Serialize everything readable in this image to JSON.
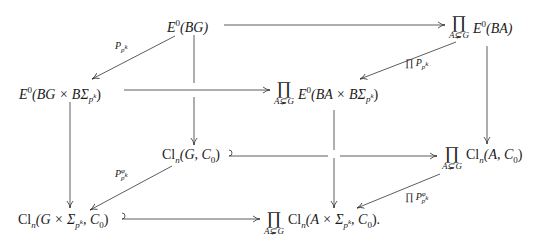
{
  "diagram": {
    "type": "commutative-cube",
    "nodes": {
      "e0_bg": {
        "label": "E⁰(BG)"
      },
      "prod_e0_ba": {
        "prod": "∏",
        "sub": "A⊊G",
        "label": "E⁰(BA)"
      },
      "e0_bg_bsigma": {
        "label": "E⁰(BG × BΣ_{p^k})"
      },
      "prod_e0_ba_bsigma": {
        "prod": "∏",
        "sub": "A⊊G",
        "label": "E⁰(BA × BΣ_{p^k})"
      },
      "cl_g": {
        "label": "Cl_n(G, C_0)"
      },
      "prod_cl_a": {
        "prod": "∏",
        "sub": "A⊊G",
        "label": "Cl_n(A, C_0)"
      },
      "cl_g_sigma": {
        "label": "Cl_n(G × Σ_{p^k}, C_0)"
      },
      "prod_cl_a_sigma": {
        "prod": "∏",
        "sub": "A⊊G",
        "label": "Cl_n(A × Σ_{p^k}, C_0)."
      }
    },
    "edge_labels": {
      "p_pk": "P_{p^k}",
      "prod_p_pk": "∏ P_{p^k}",
      "p_phi_pk": "P^φ_{p^k}",
      "prod_p_phi_pk": "∏ P^φ_{p^k}"
    },
    "text": {
      "E0": "E",
      "zero": "0",
      "BG": "(BG)",
      "BA": "(BA)",
      "prod": "∏",
      "sub": "A⊊G",
      "bg_times": "(BG × BΣ",
      "ba_times": "(BA × BΣ",
      "p": "p",
      "k": "k",
      "close": ")",
      "Cl": "Cl",
      "n": "n",
      "gc0": "(G, C",
      "ac0": "(A, C",
      "g_times": "(G × Σ",
      "a_times": "(A × Σ",
      "comma_c": ", C",
      "close_paren": ")",
      "close_dot": ").",
      "P": "P",
      "phi": "φ",
      "prodP": "∏ P"
    }
  }
}
